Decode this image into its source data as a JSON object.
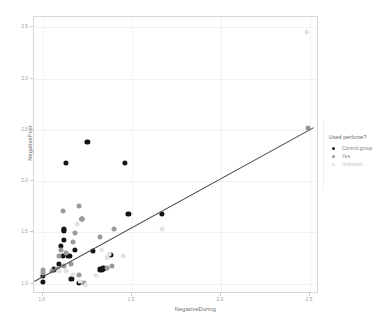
{
  "chart_data": {
    "type": "scatter",
    "title": "",
    "xlabel": "NegativeDuring",
    "ylabel": "NegativePost",
    "xlim": [
      0.95,
      2.55
    ],
    "ylim": [
      0.9,
      3.6
    ],
    "xticks": [
      "1.0",
      "1.5",
      "2.0",
      "2.5"
    ],
    "xtick_values": [
      1.0,
      1.5,
      2.0,
      2.5
    ],
    "yticks": [
      "1.0",
      "1.5",
      "2.0",
      "2.5",
      "3.0",
      "3.5"
    ],
    "ytick_values": [
      1.0,
      1.5,
      2.0,
      2.5,
      3.0,
      3.5
    ],
    "grid": true,
    "legend_position": "right",
    "legend_title": "Used perfume?",
    "colors": {
      "control_group": "#151515",
      "yes": "#9a9a9a",
      "unknown": "#e2e2e2",
      "trend_line": "#4a4a4a",
      "grid": "#f2f2f2",
      "frame": "#d7d7d7",
      "background": "#ffffff"
    },
    "trend_line": {
      "visible": true,
      "x_start": 0.95,
      "y_start": 1.03,
      "x_end": 2.52,
      "y_end": 2.53
    },
    "series": [
      {
        "name": "Control group",
        "color": "#151515",
        "points": [
          [
            1.0,
            1.08
          ],
          [
            1.0,
            1.02
          ],
          [
            1.06,
            1.14
          ],
          [
            1.09,
            1.19
          ],
          [
            1.1,
            1.37
          ],
          [
            1.11,
            1.27
          ],
          [
            1.12,
            1.52
          ],
          [
            1.12,
            1.53
          ],
          [
            1.12,
            1.43
          ],
          [
            1.13,
            2.18
          ],
          [
            1.14,
            1.27
          ],
          [
            1.15,
            1.27
          ],
          [
            1.16,
            1.05
          ],
          [
            1.18,
            1.33
          ],
          [
            1.2,
            1.01
          ],
          [
            1.22,
            1.63
          ],
          [
            1.25,
            2.38
          ],
          [
            1.28,
            1.32
          ],
          [
            1.32,
            1.14
          ],
          [
            1.33,
            1.14
          ],
          [
            1.34,
            1.15
          ],
          [
            1.38,
            1.28
          ],
          [
            1.46,
            2.18
          ],
          [
            1.48,
            1.68
          ],
          [
            1.67,
            1.68
          ]
        ]
      },
      {
        "name": "Yes",
        "color": "#9a9a9a",
        "points": [
          [
            1.0,
            1.13
          ],
          [
            1.0,
            1.1
          ],
          [
            1.05,
            1.12
          ],
          [
            1.08,
            1.14
          ],
          [
            1.09,
            1.27
          ],
          [
            1.1,
            1.33
          ],
          [
            1.11,
            1.71
          ],
          [
            1.12,
            1.17
          ],
          [
            1.13,
            1.3
          ],
          [
            1.16,
            1.19
          ],
          [
            1.17,
            1.41
          ],
          [
            1.18,
            1.49
          ],
          [
            1.2,
            1.76
          ],
          [
            1.2,
            1.09
          ],
          [
            1.22,
            1.63
          ],
          [
            1.23,
            1.01
          ],
          [
            1.32,
            1.46
          ],
          [
            1.36,
            1.15
          ],
          [
            1.39,
            1.17
          ],
          [
            1.4,
            1.53
          ],
          [
            2.49,
            2.52
          ]
        ]
      },
      {
        "name": "Unknown",
        "color": "#e2e2e2",
        "points": [
          [
            1.09,
            1.12
          ],
          [
            1.13,
            1.12
          ],
          [
            1.17,
            1.09
          ],
          [
            1.19,
            1.58
          ],
          [
            1.21,
            1.02
          ],
          [
            1.24,
            0.99
          ],
          [
            1.3,
            1.08
          ],
          [
            1.33,
            1.33
          ],
          [
            1.36,
            1.25
          ],
          [
            1.37,
            1.29
          ],
          [
            1.45,
            1.27
          ],
          [
            1.67,
            1.53
          ],
          [
            2.48,
            3.45
          ]
        ]
      }
    ]
  },
  "legend": {
    "title": "Used perfume?",
    "items": [
      {
        "label": "Control group"
      },
      {
        "label": "Yes"
      },
      {
        "label": "Unknown"
      }
    ]
  },
  "axes": {
    "x_title": "NegativeDuring",
    "y_title": "NegativePost",
    "x_ticks": [
      {
        "label": "1.0"
      },
      {
        "label": "1.5"
      },
      {
        "label": "2.0"
      },
      {
        "label": "2.5"
      }
    ],
    "y_ticks": [
      {
        "label": "1.0"
      },
      {
        "label": "1.5"
      },
      {
        "label": "2.0"
      },
      {
        "label": "2.5"
      },
      {
        "label": "3.0"
      },
      {
        "label": "3.5"
      }
    ]
  }
}
